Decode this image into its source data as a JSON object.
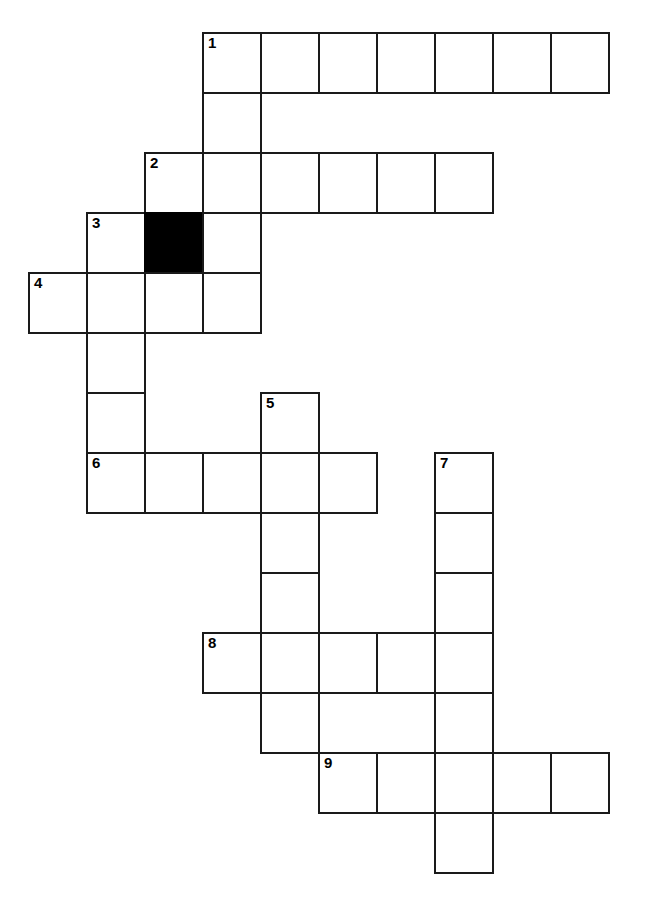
{
  "puzzle": {
    "kind": "crossword-grid",
    "title": "",
    "geometry": {
      "canvas_width": 646,
      "canvas_height": 912,
      "cell_width": 58,
      "cell_height": 60,
      "origin_x": 28,
      "origin_y": 32,
      "border_width": 2,
      "columns": 11,
      "rows": 14
    },
    "colors": {
      "grid_line": "#1a1a1a",
      "cell_fill": "#ffffff",
      "block_fill": "#000000",
      "number_color": "#000000",
      "page_background": "#ffffff"
    },
    "counts": {
      "total_cells": 61,
      "blocked_cells": 1,
      "numbered_cells": 9
    },
    "numbers": [
      "1",
      "2",
      "3",
      "4",
      "5",
      "6",
      "7",
      "8",
      "9"
    ],
    "entries": [
      {
        "number": "1",
        "direction": "across",
        "row": 0,
        "col": 3,
        "length": 7
      },
      {
        "number": "1",
        "direction": "down",
        "row": 0,
        "col": 3,
        "length": 5
      },
      {
        "number": "2",
        "direction": "across",
        "row": 2,
        "col": 2,
        "length": 6
      },
      {
        "number": "2",
        "direction": "down",
        "row": 2,
        "col": 2,
        "length": 1
      },
      {
        "number": "3",
        "direction": "across",
        "row": 3,
        "col": 1,
        "length": 3
      },
      {
        "number": "3",
        "direction": "down",
        "row": 3,
        "col": 1,
        "length": 5
      },
      {
        "number": "4",
        "direction": "across",
        "row": 4,
        "col": 0,
        "length": 4
      },
      {
        "number": "5",
        "direction": "down",
        "row": 6,
        "col": 4,
        "length": 6
      },
      {
        "number": "6",
        "direction": "across",
        "row": 7,
        "col": 1,
        "length": 5
      },
      {
        "number": "7",
        "direction": "down",
        "row": 7,
        "col": 7,
        "length": 7
      },
      {
        "number": "8",
        "direction": "across",
        "row": 10,
        "col": 3,
        "length": 5
      },
      {
        "number": "9",
        "direction": "across",
        "row": 12,
        "col": 5,
        "length": 5
      }
    ],
    "cells": [
      {
        "row": 0,
        "col": 3,
        "number": "1",
        "block": false,
        "letter": ""
      },
      {
        "row": 0,
        "col": 4,
        "number": "",
        "block": false,
        "letter": ""
      },
      {
        "row": 0,
        "col": 5,
        "number": "",
        "block": false,
        "letter": ""
      },
      {
        "row": 0,
        "col": 6,
        "number": "",
        "block": false,
        "letter": ""
      },
      {
        "row": 0,
        "col": 7,
        "number": "",
        "block": false,
        "letter": ""
      },
      {
        "row": 0,
        "col": 8,
        "number": "",
        "block": false,
        "letter": ""
      },
      {
        "row": 0,
        "col": 9,
        "number": "",
        "block": false,
        "letter": ""
      },
      {
        "row": 1,
        "col": 3,
        "number": "",
        "block": false,
        "letter": ""
      },
      {
        "row": 2,
        "col": 2,
        "number": "2",
        "block": false,
        "letter": ""
      },
      {
        "row": 2,
        "col": 3,
        "number": "",
        "block": false,
        "letter": ""
      },
      {
        "row": 2,
        "col": 4,
        "number": "",
        "block": false,
        "letter": ""
      },
      {
        "row": 2,
        "col": 5,
        "number": "",
        "block": false,
        "letter": ""
      },
      {
        "row": 2,
        "col": 6,
        "number": "",
        "block": false,
        "letter": ""
      },
      {
        "row": 2,
        "col": 7,
        "number": "",
        "block": false,
        "letter": ""
      },
      {
        "row": 3,
        "col": 1,
        "number": "3",
        "block": false,
        "letter": ""
      },
      {
        "row": 3,
        "col": 2,
        "number": "",
        "block": true,
        "letter": ""
      },
      {
        "row": 3,
        "col": 3,
        "number": "",
        "block": false,
        "letter": ""
      },
      {
        "row": 4,
        "col": 0,
        "number": "4",
        "block": false,
        "letter": ""
      },
      {
        "row": 4,
        "col": 1,
        "number": "",
        "block": false,
        "letter": ""
      },
      {
        "row": 4,
        "col": 2,
        "number": "",
        "block": false,
        "letter": ""
      },
      {
        "row": 4,
        "col": 3,
        "number": "",
        "block": false,
        "letter": ""
      },
      {
        "row": 5,
        "col": 1,
        "number": "",
        "block": false,
        "letter": ""
      },
      {
        "row": 6,
        "col": 1,
        "number": "",
        "block": false,
        "letter": ""
      },
      {
        "row": 6,
        "col": 4,
        "number": "5",
        "block": false,
        "letter": ""
      },
      {
        "row": 7,
        "col": 1,
        "number": "6",
        "block": false,
        "letter": ""
      },
      {
        "row": 7,
        "col": 2,
        "number": "",
        "block": false,
        "letter": ""
      },
      {
        "row": 7,
        "col": 3,
        "number": "",
        "block": false,
        "letter": ""
      },
      {
        "row": 7,
        "col": 4,
        "number": "",
        "block": false,
        "letter": ""
      },
      {
        "row": 7,
        "col": 5,
        "number": "",
        "block": false,
        "letter": ""
      },
      {
        "row": 7,
        "col": 7,
        "number": "7",
        "block": false,
        "letter": ""
      },
      {
        "row": 8,
        "col": 4,
        "number": "",
        "block": false,
        "letter": ""
      },
      {
        "row": 8,
        "col": 7,
        "number": "",
        "block": false,
        "letter": ""
      },
      {
        "row": 9,
        "col": 4,
        "number": "",
        "block": false,
        "letter": ""
      },
      {
        "row": 9,
        "col": 7,
        "number": "",
        "block": false,
        "letter": ""
      },
      {
        "row": 10,
        "col": 3,
        "number": "8",
        "block": false,
        "letter": ""
      },
      {
        "row": 10,
        "col": 4,
        "number": "",
        "block": false,
        "letter": ""
      },
      {
        "row": 10,
        "col": 5,
        "number": "",
        "block": false,
        "letter": ""
      },
      {
        "row": 10,
        "col": 6,
        "number": "",
        "block": false,
        "letter": ""
      },
      {
        "row": 10,
        "col": 7,
        "number": "",
        "block": false,
        "letter": ""
      },
      {
        "row": 11,
        "col": 4,
        "number": "",
        "block": false,
        "letter": ""
      },
      {
        "row": 11,
        "col": 7,
        "number": "",
        "block": false,
        "letter": ""
      },
      {
        "row": 12,
        "col": 5,
        "number": "9",
        "block": false,
        "letter": ""
      },
      {
        "row": 12,
        "col": 6,
        "number": "",
        "block": false,
        "letter": ""
      },
      {
        "row": 12,
        "col": 7,
        "number": "",
        "block": false,
        "letter": ""
      },
      {
        "row": 12,
        "col": 8,
        "number": "",
        "block": false,
        "letter": ""
      },
      {
        "row": 12,
        "col": 9,
        "number": "",
        "block": false,
        "letter": ""
      },
      {
        "row": 13,
        "col": 7,
        "number": "",
        "block": false,
        "letter": ""
      }
    ]
  }
}
